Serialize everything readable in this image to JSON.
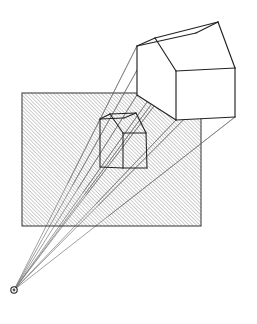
{
  "figure": {
    "type": "geometry-diagram",
    "width": 257,
    "height": 324,
    "background_color": "#ffffff",
    "stroke_color": "#333333",
    "ray_color": "#777777",
    "hatch_color": "#8a8a8a"
  },
  "eye": {
    "label": "center-of-projection",
    "x": 14,
    "y": 290,
    "radius": 3.2,
    "inner_radius": 1.4
  },
  "picture_plane": {
    "label": "picture-plane",
    "x": 22,
    "y": 93,
    "width": 179,
    "height": 133,
    "hatch_angle_deg": 45,
    "hatch_spacing": 2.6,
    "hatch_line_width": 0.85,
    "border_width": 1.0
  },
  "object_house": {
    "label": "house-object",
    "vertices": {
      "near_apex": [
        155,
        38
      ],
      "near_eave_left": [
        137,
        46
      ],
      "near_eave_right": [
        176,
        71
      ],
      "near_wall_left_bottom": [
        137,
        95
      ],
      "near_wall_right_bottom": [
        176,
        120
      ],
      "far_apex": [
        218,
        22
      ],
      "far_eave_left": [
        196,
        33
      ],
      "far_eave_right": [
        235,
        68
      ],
      "far_wall_right_bottom": [
        235,
        117
      ],
      "far_wall_left_bottom": [
        196,
        86
      ]
    },
    "edges": [
      [
        "near_apex",
        "near_eave_left"
      ],
      [
        "near_apex",
        "near_eave_right"
      ],
      [
        "near_apex",
        "far_apex"
      ],
      [
        "near_eave_left",
        "far_eave_left"
      ],
      [
        "near_eave_right",
        "far_eave_right"
      ],
      [
        "far_apex",
        "far_eave_left"
      ],
      [
        "far_apex",
        "far_eave_right"
      ],
      [
        "near_eave_left",
        "near_wall_left_bottom"
      ],
      [
        "near_eave_right",
        "near_wall_right_bottom"
      ],
      [
        "near_wall_left_bottom",
        "near_wall_right_bottom"
      ],
      [
        "far_eave_right",
        "far_wall_right_bottom"
      ],
      [
        "near_wall_right_bottom",
        "far_wall_right_bottom"
      ]
    ]
  },
  "projected_house": {
    "label": "projected-image",
    "vertices": {
      "near_apex": [
        110,
        114
      ],
      "near_eave_left": [
        100,
        119
      ],
      "near_eave_right": [
        123,
        133
      ],
      "near_wall_left_bottom": [
        100,
        167
      ],
      "near_wall_right_bottom": [
        123,
        168
      ],
      "far_apex": [
        136,
        113
      ],
      "far_eave_left": [
        124,
        118
      ],
      "far_eave_right": [
        146,
        133
      ],
      "far_wall_right_bottom": [
        147,
        168
      ],
      "far_wall_left_bottom": [
        124,
        133
      ]
    },
    "edges": [
      [
        "near_apex",
        "near_eave_left"
      ],
      [
        "near_apex",
        "near_eave_right"
      ],
      [
        "near_apex",
        "far_apex"
      ],
      [
        "near_eave_left",
        "far_eave_left"
      ],
      [
        "near_eave_right",
        "far_eave_right"
      ],
      [
        "far_apex",
        "far_eave_left"
      ],
      [
        "far_apex",
        "far_eave_right"
      ],
      [
        "near_eave_left",
        "near_wall_left_bottom"
      ],
      [
        "near_eave_right",
        "near_wall_right_bottom"
      ],
      [
        "near_wall_left_bottom",
        "near_wall_right_bottom"
      ],
      [
        "far_eave_right",
        "far_wall_right_bottom"
      ],
      [
        "near_wall_right_bottom",
        "far_wall_right_bottom"
      ]
    ]
  },
  "projection_rays": {
    "label": "projection-rays",
    "line_width": 0.7,
    "targets": [
      [
        155,
        38
      ],
      [
        137,
        46
      ],
      [
        176,
        71
      ],
      [
        137,
        95
      ],
      [
        176,
        120
      ],
      [
        218,
        22
      ],
      [
        196,
        33
      ],
      [
        235,
        68
      ],
      [
        235,
        117
      ]
    ]
  },
  "legend": {
    "caption": ""
  }
}
